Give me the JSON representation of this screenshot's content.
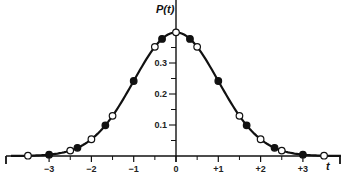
{
  "chart_data": {
    "type": "line",
    "title": "",
    "xlabel": "t",
    "ylabel": "P(t)",
    "xlim": [
      -3.9,
      3.9
    ],
    "ylim": [
      0,
      0.42
    ],
    "grid": false,
    "x_ticks": [
      -3,
      -2,
      -1,
      0,
      1,
      2,
      3
    ],
    "x_tick_labels": [
      "−3",
      "−2",
      "−1",
      "0",
      "+1",
      "+2",
      "+3"
    ],
    "x_minor_ticks": [
      -2.5,
      -1.5,
      -0.5,
      0.5,
      1.5,
      2.5
    ],
    "y_ticks": [
      0.1,
      0.2,
      0.3
    ],
    "y_tick_labels": [
      "0.1",
      "0.2",
      "0.3"
    ],
    "y_minor_ticks": [
      0.05,
      0.15,
      0.25,
      0.35
    ],
    "curve": {
      "name": "P(t)",
      "description": "standard normal density",
      "x": [
        -3.9,
        -3.5,
        -3.0,
        -2.5,
        -2.0,
        -1.5,
        -1.0,
        -0.5,
        0.0,
        0.5,
        1.0,
        1.5,
        2.0,
        2.5,
        3.0,
        3.5,
        3.9
      ],
      "y": [
        0.0002,
        0.0009,
        0.0044,
        0.0175,
        0.054,
        0.1295,
        0.242,
        0.3521,
        0.3989,
        0.3521,
        0.242,
        0.1295,
        0.054,
        0.0175,
        0.0044,
        0.0009,
        0.0002
      ]
    },
    "series": [
      {
        "name": "open circles",
        "marker": "open",
        "x": [
          -3.5,
          -2.5,
          -2.0,
          -1.5,
          -0.5,
          0.0,
          0.5,
          1.5,
          2.0,
          2.5,
          3.5
        ],
        "y": [
          0.0009,
          0.0175,
          0.054,
          0.1295,
          0.3521,
          0.3989,
          0.3521,
          0.1295,
          0.054,
          0.0175,
          0.0009
        ]
      },
      {
        "name": "filled circles",
        "marker": "filled",
        "x": [
          -3.0,
          -2.33,
          -1.67,
          -1.0,
          -0.33,
          0.33,
          1.0,
          1.67,
          2.33,
          3.0
        ],
        "y": [
          0.0044,
          0.0264,
          0.0989,
          0.242,
          0.3778,
          0.3778,
          0.242,
          0.0989,
          0.0264,
          0.0044
        ]
      }
    ]
  },
  "labels": {
    "y_axis_title": "P(t)",
    "x_axis_title": "t",
    "x_ticks": [
      "−3",
      "−2",
      "−1",
      "0",
      "+1",
      "+2",
      "+3"
    ],
    "y_ticks": [
      "0.1",
      "0.2",
      "0.3"
    ]
  }
}
